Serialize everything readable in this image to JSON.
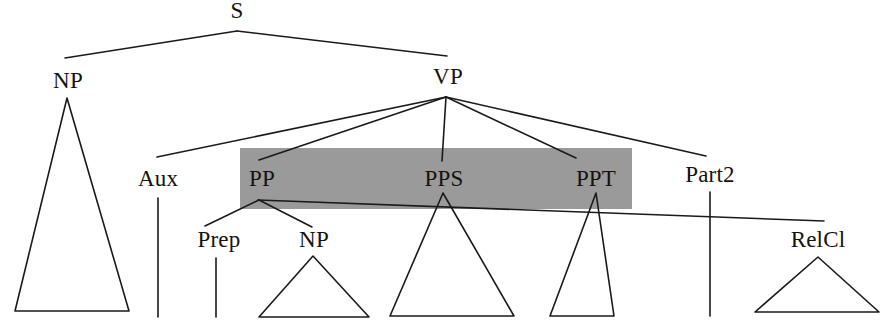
{
  "figure": {
    "kind": "syntactic-tree-diagram",
    "width": 890,
    "height": 326,
    "background_color": "#ffffff",
    "line_color": "#1a1a1a",
    "text_color": "#15120f",
    "highlight_color": "#9a9a9a"
  },
  "nodes": {
    "s": "S",
    "np_subject": "NP",
    "vp": "VP",
    "aux": "Aux",
    "pp": "PP",
    "pps": "PPS",
    "ppt": "PPT",
    "part2": "Part2",
    "prep": "Prep",
    "np_object": "NP",
    "relcl": "RelCl"
  },
  "node_positions": {
    "s": {
      "x": 237,
      "y": 22
    },
    "np_subject": {
      "x": 68,
      "y": 92
    },
    "vp": {
      "x": 448,
      "y": 88
    },
    "aux": {
      "x": 158,
      "y": 190
    },
    "pp": {
      "x": 262,
      "y": 190
    },
    "pps": {
      "x": 444,
      "y": 190
    },
    "ppt": {
      "x": 596,
      "y": 190
    },
    "part2": {
      "x": 710,
      "y": 186
    },
    "prep": {
      "x": 219,
      "y": 251
    },
    "np_object": {
      "x": 314,
      "y": 251
    },
    "relcl": {
      "x": 818,
      "y": 251
    }
  },
  "highlight_box": {
    "label": "highlighted-pp-constituents",
    "x": 240,
    "y": 148,
    "width": 392,
    "height": 61,
    "color": "#9a9a9a"
  },
  "edges": [
    {
      "name": "edge-s-np",
      "from": "s",
      "to": "np_subject",
      "x1": 237,
      "y1": 31,
      "x2": 65,
      "y2": 58
    },
    {
      "name": "edge-s-vp",
      "from": "s",
      "to": "vp",
      "x1": 237,
      "y1": 31,
      "x2": 447,
      "y2": 56
    },
    {
      "name": "edge-vp-aux",
      "from": "vp",
      "to": "aux",
      "x1": 446,
      "y1": 97,
      "x2": 157,
      "y2": 157
    },
    {
      "name": "edge-vp-pp",
      "from": "vp",
      "to": "pp",
      "x1": 446,
      "y1": 97,
      "x2": 259,
      "y2": 160
    },
    {
      "name": "edge-vp-pps",
      "from": "vp",
      "to": "pps",
      "x1": 446,
      "y1": 97,
      "x2": 442,
      "y2": 161
    },
    {
      "name": "edge-vp-ppt",
      "from": "vp",
      "to": "ppt",
      "x1": 446,
      "y1": 97,
      "x2": 576,
      "y2": 158
    },
    {
      "name": "edge-vp-part2",
      "from": "vp",
      "to": "part2",
      "x1": 446,
      "y1": 97,
      "x2": 706,
      "y2": 156
    },
    {
      "name": "edge-pp-prep",
      "from": "pp",
      "to": "prep",
      "x1": 259,
      "y1": 200,
      "x2": 205,
      "y2": 226
    },
    {
      "name": "edge-pp-np",
      "from": "pp",
      "to": "np_object",
      "x1": 259,
      "y1": 200,
      "x2": 312,
      "y2": 227
    },
    {
      "name": "edge-pp-relcl",
      "from": "pp",
      "to": "relcl",
      "x1": 258,
      "y1": 200,
      "x2": 824,
      "y2": 221
    },
    {
      "name": "edge-aux-leaf",
      "from": "aux",
      "to": "aux-leaf",
      "x1": 158,
      "y1": 198,
      "x2": 158,
      "y2": 317
    },
    {
      "name": "edge-prep-leaf",
      "from": "prep",
      "to": "prep-leaf",
      "x1": 216,
      "y1": 258,
      "x2": 216,
      "y2": 317
    },
    {
      "name": "edge-part2-leaf",
      "from": "part2",
      "to": "part2-leaf",
      "x1": 710,
      "y1": 192,
      "x2": 710,
      "y2": 316
    }
  ],
  "triangles": [
    {
      "name": "triangle-np-subject",
      "apex_x": 67,
      "apex_y": 98,
      "left_x": 15,
      "right_x": 129,
      "base_y": 311
    },
    {
      "name": "triangle-np-object",
      "apex_x": 313,
      "apex_y": 256,
      "left_x": 259,
      "right_x": 369,
      "base_y": 317
    },
    {
      "name": "triangle-pps",
      "apex_x": 443,
      "apex_y": 193,
      "left_x": 390,
      "right_x": 514,
      "base_y": 316
    },
    {
      "name": "triangle-ppt",
      "apex_x": 596,
      "apex_y": 193,
      "left_x": 550,
      "right_x": 614,
      "base_y": 316
    },
    {
      "name": "triangle-relcl",
      "apex_x": 818,
      "apex_y": 257,
      "left_x": 755,
      "right_x": 879,
      "base_y": 312
    }
  ]
}
